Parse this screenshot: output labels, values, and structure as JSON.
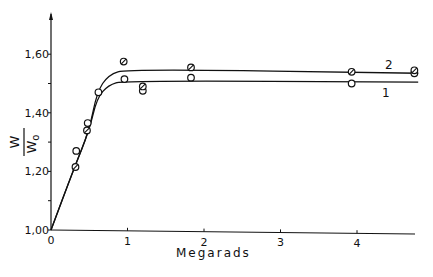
{
  "chart_data": {
    "type": "line",
    "title": "",
    "xlabel": "Megarads",
    "ylabel": "W / W0",
    "ylabel_numerator": "W",
    "ylabel_denominator": "W",
    "ylabel_denominator_sub": "o",
    "xlim": [
      0,
      4.8
    ],
    "ylim": [
      1.0,
      1.7
    ],
    "x_ticks": [
      0,
      1,
      2,
      3,
      4
    ],
    "x_tick_labels": [
      "0",
      "1",
      "2",
      "3",
      "4"
    ],
    "y_ticks": [
      1.0,
      1.2,
      1.4,
      1.6
    ],
    "y_tick_labels": [
      "1,00",
      "1,20",
      "1,40",
      "1,60"
    ],
    "grid": false,
    "legend": "inline labels at right end of curves",
    "series": [
      {
        "name": "1",
        "marker": "open circle",
        "curve": [
          [
            0,
            1.0
          ],
          [
            0.3,
            1.21
          ],
          [
            0.5,
            1.34
          ],
          [
            0.6,
            1.45
          ],
          [
            0.75,
            1.495
          ],
          [
            0.95,
            1.51
          ],
          [
            4.8,
            1.505
          ]
        ],
        "points": [
          [
            0.33,
            1.27
          ],
          [
            0.48,
            1.365
          ],
          [
            0.62,
            1.47
          ],
          [
            0.96,
            1.515
          ],
          [
            1.2,
            1.475
          ],
          [
            1.83,
            1.52
          ],
          [
            3.93,
            1.5
          ],
          [
            4.75,
            1.535
          ]
        ]
      },
      {
        "name": "2",
        "marker": "crossed circle",
        "curve": [
          [
            0,
            1.0
          ],
          [
            0.3,
            1.21
          ],
          [
            0.5,
            1.34
          ],
          [
            0.6,
            1.47
          ],
          [
            0.75,
            1.53
          ],
          [
            1.0,
            1.55
          ],
          [
            4.8,
            1.535
          ]
        ],
        "points": [
          [
            0.32,
            1.215
          ],
          [
            0.47,
            1.34
          ],
          [
            0.95,
            1.575
          ],
          [
            1.2,
            1.49
          ],
          [
            1.83,
            1.555
          ],
          [
            3.93,
            1.54
          ],
          [
            4.75,
            1.545
          ]
        ]
      }
    ]
  },
  "labels": {
    "series1": "1",
    "series2": "2"
  }
}
